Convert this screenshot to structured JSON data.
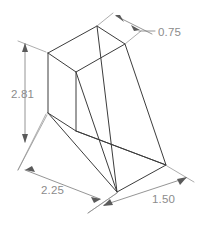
{
  "drawing": {
    "title": "Isometric wedge bracket",
    "view_type": "isometric",
    "line_color": "#3c3c3c",
    "dimension_color": "#8c8c8c",
    "background_color": "#ffffff",
    "dimensions": [
      {
        "id": "depth-top",
        "label": "0.75",
        "placement": "top-right",
        "text_x": 158,
        "text_y": 33
      },
      {
        "id": "height-left",
        "label": "2.81",
        "placement": "left",
        "text_x": 11,
        "text_y": 95
      },
      {
        "id": "width-bottom",
        "label": "2.25",
        "placement": "bottom-left",
        "text_x": 41,
        "text_y": 191
      },
      {
        "id": "depth-bottom-right",
        "label": "1.50",
        "placement": "bottom-right",
        "text_x": 152,
        "text_y": 200
      }
    ]
  }
}
